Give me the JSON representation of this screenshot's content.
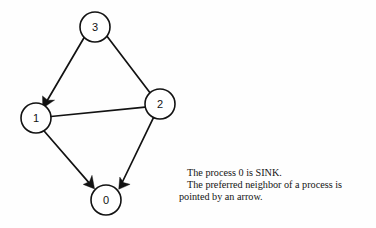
{
  "figure": {
    "type": "directed-graph",
    "background_color": "#fefefe",
    "ink_color": "#121212",
    "nodes": [
      {
        "id": "3",
        "label": "3",
        "cx": 95,
        "cy": 27,
        "r": 15
      },
      {
        "id": "2",
        "label": "2",
        "cx": 160,
        "cy": 104,
        "r": 15
      },
      {
        "id": "1",
        "label": "1",
        "cx": 36,
        "cy": 118,
        "r": 15
      },
      {
        "id": "0",
        "label": "0",
        "cx": 106,
        "cy": 200,
        "r": 15
      }
    ],
    "edges": [
      {
        "from": "3",
        "to": "1",
        "directed": true,
        "arrow_at": "1"
      },
      {
        "from": "3",
        "to": "2",
        "directed": false,
        "arrow_at": ""
      },
      {
        "from": "2",
        "to": "1",
        "directed": false,
        "arrow_at": ""
      },
      {
        "from": "1",
        "to": "0",
        "directed": true,
        "arrow_at": "0"
      },
      {
        "from": "2",
        "to": "0",
        "directed": true,
        "arrow_at": "0"
      }
    ]
  },
  "caption": {
    "line1": "The process 0 is SINK.",
    "line2": "The preferred neighbor of a process is",
    "line3": "pointed by an arrow."
  }
}
